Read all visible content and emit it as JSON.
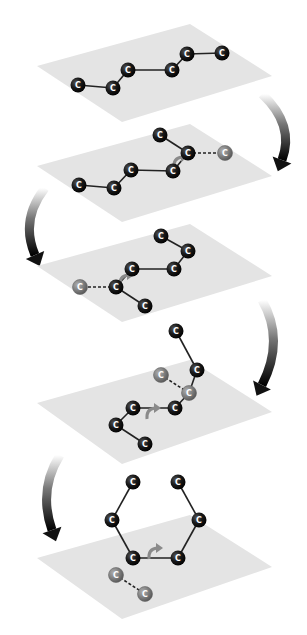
{
  "diagram": {
    "colors": {
      "background": "#ffffff",
      "plane": "#e4e4e4",
      "atom_fill": "#111111",
      "atom_label": "#ffffff",
      "ghost_atom_fill": "#7a7a7a",
      "bond": "#222222",
      "rotation_arrow": "#8a8a8a",
      "step_arrow_dark": "#111111",
      "step_arrow_light": "#ffffff"
    },
    "atom_symbol": "C",
    "panels": [
      {
        "id": "step-1",
        "plane": [
          [
            37,
            66
          ],
          [
            190,
            24
          ],
          [
            272,
            76
          ],
          [
            122,
            122
          ]
        ],
        "atoms": [
          {
            "x": 78,
            "y": 85,
            "label": "C"
          },
          {
            "x": 113,
            "y": 88,
            "label": "C"
          },
          {
            "x": 128,
            "y": 70,
            "label": "C"
          },
          {
            "x": 172,
            "y": 70,
            "label": "C"
          },
          {
            "x": 187,
            "y": 54,
            "label": "C"
          },
          {
            "x": 222,
            "y": 53,
            "label": "C"
          }
        ],
        "ghost_atoms": [],
        "bonds": [
          [
            0,
            1
          ],
          [
            1,
            2
          ],
          [
            2,
            3
          ],
          [
            3,
            4
          ],
          [
            4,
            5
          ]
        ],
        "dashed_bonds": [],
        "rotation_arrow": null
      },
      {
        "id": "step-2",
        "plane": [
          [
            37,
            166
          ],
          [
            190,
            124
          ],
          [
            272,
            176
          ],
          [
            122,
            222
          ]
        ],
        "atoms": [
          {
            "x": 79,
            "y": 185,
            "label": "C"
          },
          {
            "x": 114,
            "y": 188,
            "label": "C"
          },
          {
            "x": 131,
            "y": 170,
            "label": "C"
          },
          {
            "x": 173,
            "y": 171,
            "label": "C"
          },
          {
            "x": 188,
            "y": 153,
            "label": "C"
          },
          {
            "x": 160,
            "y": 135,
            "label": "C"
          }
        ],
        "ghost_atoms": [
          {
            "x": 225,
            "y": 153,
            "label": "C"
          }
        ],
        "bonds": [
          [
            0,
            1
          ],
          [
            1,
            2
          ],
          [
            2,
            3
          ],
          [
            3,
            4
          ],
          [
            4,
            5
          ]
        ],
        "dashed_bonds": [
          [
            [
              188,
              153
            ],
            [
              225,
              153
            ]
          ]
        ],
        "rotation_arrow": {
          "x": 180,
          "y": 162
        }
      },
      {
        "id": "step-3",
        "plane": [
          [
            37,
            266
          ],
          [
            190,
            224
          ],
          [
            272,
            276
          ],
          [
            122,
            322
          ]
        ],
        "atoms": [
          {
            "x": 145,
            "y": 306,
            "label": "C"
          },
          {
            "x": 116,
            "y": 287,
            "label": "C"
          },
          {
            "x": 132,
            "y": 269,
            "label": "C"
          },
          {
            "x": 174,
            "y": 269,
            "label": "C"
          },
          {
            "x": 188,
            "y": 251,
            "label": "C"
          },
          {
            "x": 161,
            "y": 236,
            "label": "C"
          }
        ],
        "ghost_atoms": [
          {
            "x": 80,
            "y": 287,
            "label": "C"
          }
        ],
        "bonds": [
          [
            0,
            1
          ],
          [
            1,
            2
          ],
          [
            2,
            3
          ],
          [
            3,
            4
          ],
          [
            4,
            5
          ]
        ],
        "dashed_bonds": [
          [
            [
              116,
              287
            ],
            [
              80,
              287
            ]
          ]
        ],
        "rotation_arrow": {
          "x": 126,
          "y": 280
        }
      },
      {
        "id": "step-4",
        "plane": [
          [
            37,
            403
          ],
          [
            190,
            360
          ],
          [
            272,
            412
          ],
          [
            122,
            464
          ]
        ],
        "atoms": [
          {
            "x": 145,
            "y": 444,
            "label": "C"
          },
          {
            "x": 116,
            "y": 425,
            "label": "C"
          },
          {
            "x": 133,
            "y": 408,
            "label": "C"
          },
          {
            "x": 175,
            "y": 408,
            "label": "C"
          },
          {
            "x": 197,
            "y": 370,
            "label": "C"
          },
          {
            "x": 176,
            "y": 331,
            "label": "C"
          }
        ],
        "ghost_atoms": [
          {
            "x": 161,
            "y": 375,
            "label": "C"
          },
          {
            "x": 189,
            "y": 393,
            "label": "C"
          }
        ],
        "bonds": [
          [
            0,
            1
          ],
          [
            1,
            2
          ],
          [
            2,
            3
          ],
          [
            4,
            5
          ]
        ],
        "solid_extra_bonds": [
          [
            [
              175,
              408
            ],
            [
              189,
              393
            ]
          ],
          [
            [
              189,
              393
            ],
            [
              197,
              370
            ]
          ]
        ],
        "dashed_bonds": [
          [
            [
              161,
              375
            ],
            [
              189,
              393
            ]
          ]
        ],
        "rotation_arrow": {
          "x": 153,
          "y": 413
        }
      },
      {
        "id": "step-5",
        "plane": [
          [
            37,
            558
          ],
          [
            190,
            515
          ],
          [
            272,
            567
          ],
          [
            122,
            619
          ]
        ],
        "atoms": [
          {
            "x": 133,
            "y": 558,
            "label": "C"
          },
          {
            "x": 112,
            "y": 520,
            "label": "C"
          },
          {
            "x": 133,
            "y": 482,
            "label": "C"
          },
          {
            "x": 178,
            "y": 482,
            "label": "C"
          },
          {
            "x": 199,
            "y": 520,
            "label": "C"
          },
          {
            "x": 178,
            "y": 558,
            "label": "C"
          }
        ],
        "ghost_atoms": [
          {
            "x": 116,
            "y": 575,
            "label": "C"
          },
          {
            "x": 145,
            "y": 594,
            "label": "C"
          }
        ],
        "bonds": [
          [
            0,
            1
          ],
          [
            1,
            2
          ],
          [
            3,
            4
          ],
          [
            4,
            5
          ],
          [
            5,
            0
          ]
        ],
        "dashed_bonds": [
          [
            [
              116,
              575
            ],
            [
              145,
              594
            ]
          ]
        ],
        "rotation_arrow": {
          "x": 155,
          "y": 553
        }
      }
    ],
    "step_arrows": [
      {
        "id": "arrow-1-to-2",
        "side": "right",
        "start": [
          262,
          94
        ],
        "ctrl": [
          295,
          125
        ],
        "end": [
          282,
          160
        ]
      },
      {
        "id": "arrow-2-to-3",
        "side": "left",
        "start": [
          45,
          188
        ],
        "ctrl": [
          20,
          220
        ],
        "end": [
          35,
          255
        ]
      },
      {
        "id": "arrow-3-to-4",
        "side": "right",
        "start": [
          262,
          300
        ],
        "ctrl": [
          285,
          340
        ],
        "end": [
          262,
          385
        ]
      },
      {
        "id": "arrow-4-to-5",
        "side": "left",
        "start": [
          60,
          455
        ],
        "ctrl": [
          38,
          490
        ],
        "end": [
          52,
          530
        ]
      }
    ]
  }
}
